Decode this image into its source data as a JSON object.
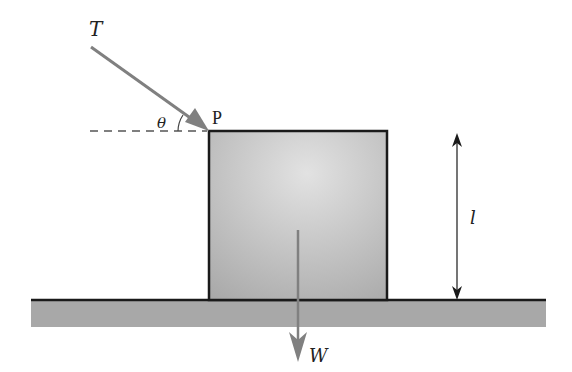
{
  "diagram": {
    "labels": {
      "tension": "T",
      "angle": "θ",
      "point": "P",
      "weight": "W",
      "height": "l"
    },
    "colors": {
      "arrow": "#808080",
      "block_fill_light": "#d8d8d8",
      "block_fill_dark": "#a8a8a8",
      "ground": "#a9a9a9",
      "outline": "#1a1a1a",
      "dash": "#555555"
    }
  }
}
